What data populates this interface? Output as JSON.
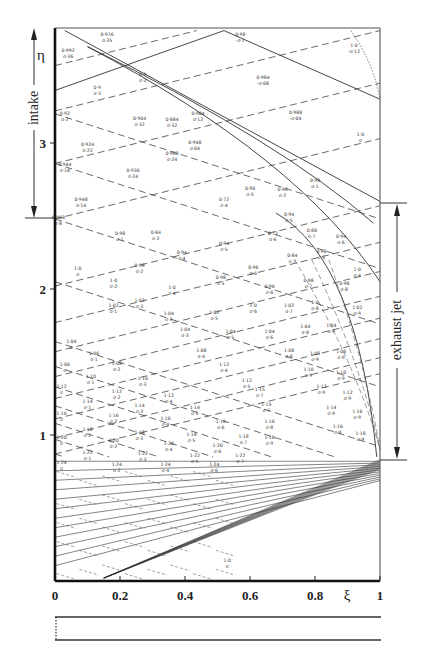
{
  "figure": {
    "type": "characteristics-net",
    "x_axis": {
      "symbol": "ξ",
      "ticks": [
        "0",
        "0.2",
        "0.4",
        "0.6",
        "0.8",
        "1"
      ],
      "range": [
        0,
        1
      ]
    },
    "y_axis": {
      "symbol": "η",
      "ticks": [
        "1",
        "2",
        "3"
      ],
      "range": [
        0,
        3.77
      ]
    },
    "regions": [
      {
        "label": "intake",
        "eta_from": 2.48,
        "eta_to": 3.77,
        "side": "left"
      },
      {
        "label": "exhaust jet",
        "eta_from": 0.82,
        "eta_to": 2.58,
        "side": "right"
      }
    ],
    "cells": [
      {
        "xi": 0.04,
        "eta": 3.62,
        "l1": "0·992",
        "l2": "σ·36"
      },
      {
        "xi": 0.16,
        "eta": 3.73,
        "l1": "0·976",
        "l2": "σ·35"
      },
      {
        "xi": 0.57,
        "eta": 3.73,
        "l1": "0·98",
        "l2": "-σ·1"
      },
      {
        "xi": 0.13,
        "eta": 3.37,
        "l1": "0·9",
        "l2": "σ·3"
      },
      {
        "xi": 0.27,
        "eta": 3.46,
        "l1": "0·9",
        "l2": "σ·2"
      },
      {
        "xi": 0.03,
        "eta": 3.19,
        "l1": "0·92",
        "l2": "σ·2"
      },
      {
        "xi": 0.26,
        "eta": 3.16,
        "l1": "0·904",
        "l2": "σ·32"
      },
      {
        "xi": 0.36,
        "eta": 3.15,
        "l1": "0·884",
        "l2": "σ·32"
      },
      {
        "xi": 0.44,
        "eta": 3.19,
        "l1": "0·904",
        "l2": "σ·12"
      },
      {
        "xi": 0.64,
        "eta": 3.44,
        "l1": "0·984",
        "l2": "-σ·08"
      },
      {
        "xi": 0.74,
        "eta": 3.2,
        "l1": "0·988",
        "l2": "-σ·04"
      },
      {
        "xi": 0.1,
        "eta": 2.98,
        "l1": "0·924",
        "l2": "σ·22"
      },
      {
        "xi": 0.03,
        "eta": 2.84,
        "l1": "0·944",
        "l2": "σ·18"
      },
      {
        "xi": 0.24,
        "eta": 2.8,
        "l1": "0·936",
        "l2": "σ·24"
      },
      {
        "xi": 0.36,
        "eta": 2.92,
        "l1": "0·968",
        "l2": "σ·24"
      },
      {
        "xi": 0.43,
        "eta": 2.99,
        "l1": "0·948",
        "l2": "σ·04"
      },
      {
        "xi": 0.08,
        "eta": 2.6,
        "l1": "0·948",
        "l2": "σ·14"
      },
      {
        "xi": 0.01,
        "eta": 2.48,
        "l1": "0·968",
        "l2": "σ·8"
      },
      {
        "xi": 0.31,
        "eta": 2.38,
        "l1": "0·84",
        "l2": "σ·2"
      },
      {
        "xi": 0.52,
        "eta": 2.6,
        "l1": "0·72",
        "l2": "σ·4"
      },
      {
        "xi": 0.6,
        "eta": 2.68,
        "l1": "0·90",
        "l2": "σ·5"
      },
      {
        "xi": 0.7,
        "eta": 2.67,
        "l1": "0·96",
        "l2": "σ·2"
      },
      {
        "xi": 0.8,
        "eta": 2.73,
        "l1": "0·98",
        "l2": "σ·1"
      },
      {
        "xi": 0.94,
        "eta": 3.05,
        "l1": "1·0",
        "l2": "σ"
      },
      {
        "xi": 0.92,
        "eta": 3.66,
        "l1": "1·0",
        "l2": "-σ·12"
      },
      {
        "xi": 0.2,
        "eta": 2.37,
        "l1": "0·98",
        "l2": "σ·1"
      },
      {
        "xi": 0.07,
        "eta": 2.13,
        "l1": "1·0",
        "l2": "σ"
      },
      {
        "xi": 0.72,
        "eta": 2.5,
        "l1": "0·94",
        "l2": "σ·5"
      },
      {
        "xi": 0.79,
        "eta": 2.39,
        "l1": "0·88",
        "l2": "σ·7"
      },
      {
        "xi": 0.88,
        "eta": 2.35,
        "l1": "0·94",
        "l2": "σ·6"
      },
      {
        "xi": 0.67,
        "eta": 2.37,
        "l1": "0·72",
        "l2": "σ·6"
      },
      {
        "xi": 0.52,
        "eta": 2.3,
        "l1": "0·94",
        "l2": "σ·5"
      },
      {
        "xi": 0.39,
        "eta": 2.24,
        "l1": "0·94",
        "l2": "σ·4"
      },
      {
        "xi": 0.26,
        "eta": 2.15,
        "l1": "0·98",
        "l2": "σ·2"
      },
      {
        "xi": 0.18,
        "eta": 2.05,
        "l1": "1·0",
        "l2": "σ·2"
      },
      {
        "xi": 0.61,
        "eta": 2.14,
        "l1": "0·96",
        "l2": "σ·6"
      },
      {
        "xi": 0.73,
        "eta": 2.22,
        "l1": "0·84",
        "l2": "σ·7"
      },
      {
        "xi": 0.82,
        "eta": 2.25,
        "l1": "0·98",
        "l2": "σ·5"
      },
      {
        "xi": 0.93,
        "eta": 2.12,
        "l1": "1·0",
        "l2": "σ·4"
      },
      {
        "xi": 0.51,
        "eta": 2.07,
        "l1": "0·98",
        "l2": "σ·5"
      },
      {
        "xi": 0.36,
        "eta": 2.0,
        "l1": "1·0",
        "l2": "σ·4"
      },
      {
        "xi": 0.26,
        "eta": 1.91,
        "l1": "1·02",
        "l2": "σ·3"
      },
      {
        "xi": 0.66,
        "eta": 2.01,
        "l1": "0·96",
        "l2": "σ·6"
      },
      {
        "xi": 0.78,
        "eta": 2.05,
        "l1": "0·98",
        "l2": "σ·7"
      },
      {
        "xi": 0.89,
        "eta": 2.03,
        "l1": "0·98",
        "l2": "σ·8"
      },
      {
        "xi": 0.18,
        "eta": 1.88,
        "l1": "1·02",
        "l2": "σ·1"
      },
      {
        "xi": 0.35,
        "eta": 1.82,
        "l1": "1·04",
        "l2": "σ·3"
      },
      {
        "xi": 0.49,
        "eta": 1.83,
        "l1": "1·02",
        "l2": "σ·5"
      },
      {
        "xi": 0.61,
        "eta": 1.88,
        "l1": "1·0",
        "l2": "σ·6"
      },
      {
        "xi": 0.72,
        "eta": 1.88,
        "l1": "1·02",
        "l2": "σ·7"
      },
      {
        "xi": 0.8,
        "eta": 1.9,
        "l1": "1·0",
        "l2": "σ·8"
      },
      {
        "xi": 0.93,
        "eta": 1.86,
        "l1": "1·02",
        "l2": "σ·9"
      },
      {
        "xi": 0.4,
        "eta": 1.71,
        "l1": "1·04",
        "l2": "σ·3"
      },
      {
        "xi": 0.54,
        "eta": 1.7,
        "l1": "1·04",
        "l2": "σ·5"
      },
      {
        "xi": 0.66,
        "eta": 1.7,
        "l1": "1·04",
        "l2": "σ·6"
      },
      {
        "xi": 0.77,
        "eta": 1.73,
        "l1": "1·04",
        "l2": "σ·8"
      },
      {
        "xi": 0.85,
        "eta": 1.74,
        "l1": "1·04",
        "l2": "σ·9"
      },
      {
        "xi": 0.45,
        "eta": 1.57,
        "l1": "1·08",
        "l2": "σ·4"
      },
      {
        "xi": 0.52,
        "eta": 1.47,
        "l1": "1·12",
        "l2": "σ·4"
      },
      {
        "xi": 0.59,
        "eta": 1.36,
        "l1": "1·12",
        "l2": "σ·5"
      },
      {
        "xi": 0.63,
        "eta": 1.3,
        "l1": "1·15",
        "l2": "σ·7"
      },
      {
        "xi": 0.65,
        "eta": 1.2,
        "l1": "1·15",
        "l2": "σ·7"
      },
      {
        "xi": 0.66,
        "eta": 1.08,
        "l1": "1·16",
        "l2": "σ·8"
      },
      {
        "xi": 0.66,
        "eta": 0.97,
        "l1": "1·18",
        "l2": "σ·9"
      },
      {
        "xi": 0.72,
        "eta": 1.57,
        "l1": "1·08",
        "l2": "σ·8"
      },
      {
        "xi": 0.8,
        "eta": 1.55,
        "l1": "1·08",
        "l2": "σ·9"
      },
      {
        "xi": 0.88,
        "eta": 1.56,
        "l1": "1·06",
        "l2": "σ·9"
      },
      {
        "xi": 0.78,
        "eta": 1.44,
        "l1": "1·10",
        "l2": "σ·9"
      },
      {
        "xi": 0.88,
        "eta": 1.42,
        "l1": "1·10",
        "l2": "σ·9"
      },
      {
        "xi": 0.82,
        "eta": 1.32,
        "l1": "1·12",
        "l2": "σ·9"
      },
      {
        "xi": 0.9,
        "eta": 1.28,
        "l1": "1·12",
        "l2": "σ·9"
      },
      {
        "xi": 0.85,
        "eta": 1.18,
        "l1": "1·14",
        "l2": "σ·9"
      },
      {
        "xi": 0.93,
        "eta": 1.15,
        "l1": "1·16",
        "l2": "σ·9"
      },
      {
        "xi": 0.87,
        "eta": 1.05,
        "l1": "1·16",
        "l2": "σ·9"
      },
      {
        "xi": 0.94,
        "eta": 1.0,
        "l1": "1·18",
        "l2": "σ·9"
      },
      {
        "xi": 0.05,
        "eta": 1.63,
        "l1": "1·04",
        "l2": "σ"
      },
      {
        "xi": 0.12,
        "eta": 1.55,
        "l1": "1·06",
        "l2": "σ·1"
      },
      {
        "xi": 0.03,
        "eta": 1.47,
        "l1": "1·06",
        "l2": "σ"
      },
      {
        "xi": 0.19,
        "eta": 1.48,
        "l1": "1·08",
        "l2": "σ·2"
      },
      {
        "xi": 0.11,
        "eta": 1.39,
        "l1": "1·10",
        "l2": "σ·1"
      },
      {
        "xi": 0.27,
        "eta": 1.38,
        "l1": "1·10",
        "l2": "σ·3"
      },
      {
        "xi": 0.02,
        "eta": 1.32,
        "l1": "1·12",
        "l2": "σ"
      },
      {
        "xi": 0.19,
        "eta": 1.29,
        "l1": "1·12",
        "l2": "σ·2"
      },
      {
        "xi": 0.35,
        "eta": 1.26,
        "l1": "1·12",
        "l2": "σ·4"
      },
      {
        "xi": 0.1,
        "eta": 1.22,
        "l1": "1·14",
        "l2": "σ·1"
      },
      {
        "xi": 0.26,
        "eta": 1.19,
        "l1": "1·14",
        "l2": "σ·3"
      },
      {
        "xi": 0.43,
        "eta": 1.18,
        "l1": "1·14",
        "l2": "σ·5"
      },
      {
        "xi": 0.02,
        "eta": 1.14,
        "l1": "1·16",
        "l2": "σ"
      },
      {
        "xi": 0.18,
        "eta": 1.12,
        "l1": "1·16",
        "l2": "σ·2"
      },
      {
        "xi": 0.34,
        "eta": 1.1,
        "l1": "1·16",
        "l2": "σ·4"
      },
      {
        "xi": 0.51,
        "eta": 1.08,
        "l1": "1·16",
        "l2": "σ·6"
      },
      {
        "xi": 0.1,
        "eta": 1.03,
        "l1": "1·18",
        "l2": "σ·1"
      },
      {
        "xi": 0.26,
        "eta": 1.01,
        "l1": "1·18",
        "l2": "σ·3"
      },
      {
        "xi": 0.42,
        "eta": 0.99,
        "l1": "1·18",
        "l2": "σ·5"
      },
      {
        "xi": 0.58,
        "eta": 0.98,
        "l1": "1·18",
        "l2": "σ·7"
      },
      {
        "xi": 0.02,
        "eta": 0.97,
        "l1": "1·20",
        "l2": "σ"
      },
      {
        "xi": 0.18,
        "eta": 0.95,
        "l1": "1·20",
        "l2": "σ·2"
      },
      {
        "xi": 0.35,
        "eta": 0.93,
        "l1": "1·20",
        "l2": "σ·4"
      },
      {
        "xi": 0.5,
        "eta": 0.92,
        "l1": "1·20",
        "l2": "σ·6"
      },
      {
        "xi": 0.1,
        "eta": 0.87,
        "l1": "1·22",
        "l2": "σ·1"
      },
      {
        "xi": 0.27,
        "eta": 0.86,
        "l1": "1·22",
        "l2": "σ·3"
      },
      {
        "xi": 0.43,
        "eta": 0.85,
        "l1": "1·22",
        "l2": "σ·5"
      },
      {
        "xi": 0.57,
        "eta": 0.85,
        "l1": "1·22",
        "l2": "σ·7"
      },
      {
        "xi": 0.02,
        "eta": 0.8,
        "l1": "1·24",
        "l2": "σ"
      },
      {
        "xi": 0.19,
        "eta": 0.79,
        "l1": "1·24",
        "l2": "σ·2"
      },
      {
        "xi": 0.34,
        "eta": 0.79,
        "l1": "1·24",
        "l2": "σ·4"
      },
      {
        "xi": 0.49,
        "eta": 0.79,
        "l1": "1·24",
        "l2": "σ·6"
      },
      {
        "xi": 0.53,
        "eta": 0.13,
        "l1": "1·0",
        "l2": "σ"
      }
    ]
  }
}
